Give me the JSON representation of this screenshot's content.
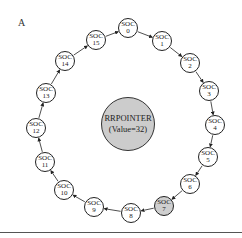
{
  "figure": {
    "panel_label": "A",
    "center": {
      "title": "RRPOINTER",
      "value_label": "(Value=32)",
      "fill": "#cccccc"
    },
    "node_prefix": "SOC",
    "active_node_index": 7,
    "active_fill": "#cfcfcf",
    "nodes": [
      {
        "label": "SOC",
        "index": "0",
        "x": 128,
        "y": 28
      },
      {
        "label": "SOC",
        "index": "1",
        "x": 162,
        "y": 41
      },
      {
        "label": "SOC",
        "index": "2",
        "x": 190,
        "y": 63
      },
      {
        "label": "SOC",
        "index": "3",
        "x": 209,
        "y": 91
      },
      {
        "label": "SOC",
        "index": "4",
        "x": 215,
        "y": 125
      },
      {
        "label": "SOC",
        "index": "5",
        "x": 208,
        "y": 157
      },
      {
        "label": "SOC",
        "index": "6",
        "x": 190,
        "y": 184
      },
      {
        "label": "SOC",
        "index": "7",
        "x": 164,
        "y": 206
      },
      {
        "label": "SOC",
        "index": "8",
        "x": 131,
        "y": 213
      },
      {
        "label": "SOC",
        "index": "9",
        "x": 94,
        "y": 207
      },
      {
        "label": "SOC",
        "index": "10",
        "x": 64,
        "y": 190
      },
      {
        "label": "SOC",
        "index": "11",
        "x": 45,
        "y": 162
      },
      {
        "label": "SOC",
        "index": "12",
        "x": 36,
        "y": 128
      },
      {
        "label": "SOC",
        "index": "13",
        "x": 46,
        "y": 93
      },
      {
        "label": "SOC",
        "index": "14",
        "x": 65,
        "y": 61
      },
      {
        "label": "SOC",
        "index": "15",
        "x": 96,
        "y": 40
      }
    ],
    "edges_direction": "clockwise (0→1→…→15→0)"
  }
}
